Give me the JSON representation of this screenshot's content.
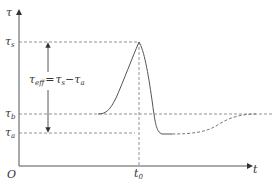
{
  "axes": {
    "y_label": "τ",
    "x_label": "t",
    "origin_label": "O"
  },
  "levels": {
    "tau_s": {
      "symbol": "τ",
      "sub": "s"
    },
    "tau_b": {
      "symbol": "τ",
      "sub": "b"
    },
    "tau_a": {
      "symbol": "τ",
      "sub": "a"
    }
  },
  "time_mark": {
    "symbol": "t",
    "sub": "0"
  },
  "annotation": {
    "lhs_symbol": "τ",
    "lhs_sub": "eff",
    "equals": "=",
    "rhs1_symbol": "τ",
    "rhs1_sub": "s",
    "minus": "−",
    "rhs2_symbol": "τ",
    "rhs2_sub": "a"
  },
  "colors": {
    "line": "#555555",
    "dash": "#777777"
  }
}
